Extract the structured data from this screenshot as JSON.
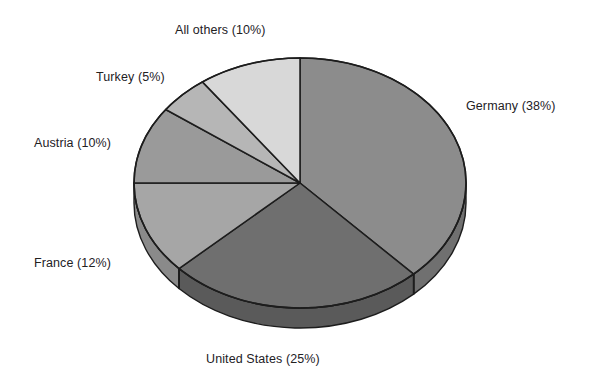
{
  "chart_data": {
    "type": "pie",
    "title": "",
    "subtitle": "",
    "xlabel": "",
    "ylabel": "",
    "legend_position": "none",
    "grid": false,
    "three_d": true,
    "start_angle_deg": 0,
    "direction": "clockwise",
    "units": "percent",
    "categories": [
      "Germany",
      "United States",
      "France",
      "Austria",
      "Turkey",
      "All others"
    ],
    "values": [
      38,
      25,
      12,
      10,
      5,
      10
    ],
    "labels": [
      "Germany (38%)",
      "United States (25%)",
      "France (12%)",
      "Austria (10%)",
      "Turkey (5%)",
      "All others (10%)"
    ],
    "slices": [
      {
        "name": "Germany",
        "value": 38,
        "label": "Germany (38%)",
        "color": "#8c8c8c",
        "side_color": "#707070",
        "start_deg": 0,
        "end_deg": 136.8
      },
      {
        "name": "United States",
        "value": 25,
        "label": "United States (25%)",
        "color": "#6f6f6f",
        "side_color": "#5a5a5a",
        "start_deg": 136.8,
        "end_deg": 226.8
      },
      {
        "name": "France",
        "value": 12,
        "label": "France (12%)",
        "color": "#a6a6a6",
        "side_color": "#8a8a8a",
        "start_deg": 226.8,
        "end_deg": 270.0
      },
      {
        "name": "Austria",
        "value": 10,
        "label": "Austria (10%)",
        "color": "#9a9a9a",
        "side_color": "#808080",
        "start_deg": 270.0,
        "end_deg": 306.0
      },
      {
        "name": "Turkey",
        "value": 5,
        "label": "Turkey (5%)",
        "color": "#b6b6b6",
        "side_color": "#969696",
        "start_deg": 306.0,
        "end_deg": 324.0
      },
      {
        "name": "All others",
        "value": 10,
        "label": "All others (10%)",
        "color": "#d8d8d8",
        "side_color": "#b4b4b4",
        "start_deg": 324.0,
        "end_deg": 360.0
      }
    ],
    "colors": {
      "background": "#ffffff",
      "outline": "#1d1d1d",
      "text": "#23211f"
    }
  }
}
